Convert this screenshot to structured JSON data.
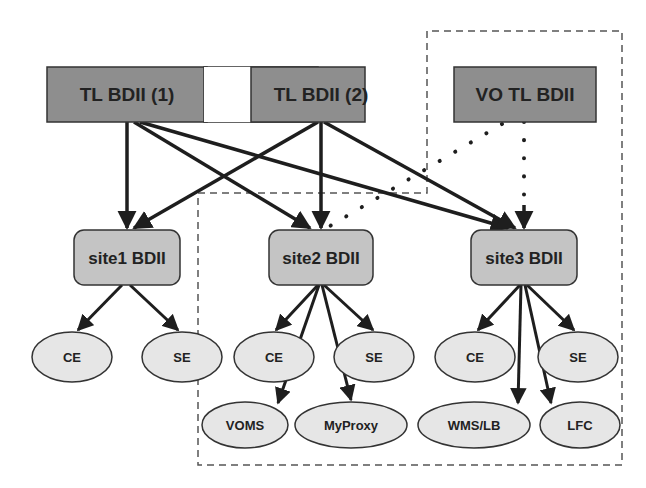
{
  "diagram": {
    "colors": {
      "top_box_fill": "#8e8e8e",
      "site_box_fill": "#c4c4c4",
      "service_fill": "#e6e6e6",
      "stroke": "#1e1e1e",
      "text": "#222222",
      "dashed_region": "#555555"
    },
    "top_level": [
      {
        "id": "tl1",
        "label": "TL BDII (1)"
      },
      {
        "id": "tl2",
        "label": "TL BDII (2)"
      },
      {
        "id": "vo",
        "label": "VO TL BDII"
      }
    ],
    "sites": [
      {
        "id": "site1",
        "label": "site1 BDII",
        "services": [
          "CE",
          "SE"
        ]
      },
      {
        "id": "site2",
        "label": "site2 BDII",
        "services": [
          "CE",
          "SE",
          "VOMS",
          "MyProxy"
        ]
      },
      {
        "id": "site3",
        "label": "site3 BDII",
        "services": [
          "CE",
          "SE",
          "WMS/LB",
          "LFC"
        ]
      }
    ],
    "edges": [
      {
        "from": "TL BDII (1)",
        "to": "site1 BDII",
        "style": "solid"
      },
      {
        "from": "TL BDII (1)",
        "to": "site2 BDII",
        "style": "solid"
      },
      {
        "from": "TL BDII (1)",
        "to": "site3 BDII",
        "style": "solid"
      },
      {
        "from": "TL BDII (2)",
        "to": "site1 BDII",
        "style": "solid"
      },
      {
        "from": "TL BDII (2)",
        "to": "site2 BDII",
        "style": "solid"
      },
      {
        "from": "TL BDII (2)",
        "to": "site3 BDII",
        "style": "solid"
      },
      {
        "from": "VO TL BDII",
        "to": "site2 BDII",
        "style": "dotted"
      },
      {
        "from": "VO TL BDII",
        "to": "site3 BDII",
        "style": "dotted"
      }
    ],
    "dashed_region_note": "VO TL BDII, site2 BDII and site3 BDII enclosed in a dashed boundary"
  }
}
